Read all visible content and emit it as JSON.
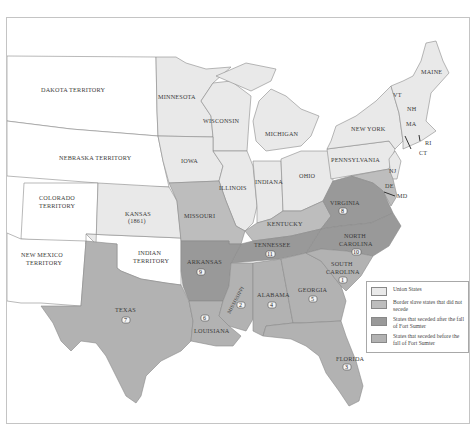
{
  "colors": {
    "union": "#e9e9e9",
    "border_slave": "#bdbdbd",
    "seceded_after": "#999999",
    "seceded_before": "#b2b2b2",
    "territory": "#ffffff",
    "frame": "#c4c4c4"
  },
  "territories": {
    "dakota": "DAKOTA TERRITORY",
    "nebraska": "NEBRASKA TERRITORY",
    "colorado_1": "COLORADO",
    "colorado_2": "TERRITORY",
    "new_mexico_1": "NEW MEXICO",
    "new_mexico_2": "TERRITORY",
    "indian_1": "INDIAN",
    "indian_2": "TERRITORY"
  },
  "union_states": {
    "minnesota": "MINNESOTA",
    "wisconsin": "WISCONSIN",
    "michigan": "MICHIGAN",
    "iowa": "IOWA",
    "illinois": "ILLINOIS",
    "indiana": "INDIANA",
    "ohio": "OHIO",
    "kansas": "KANSAS",
    "kansas_year": "(1861)",
    "pennsylvania": "PENNSYLVANIA",
    "new_york": "NEW YORK",
    "maine": "MAINE",
    "vermont": "VT",
    "new_hampshire": "NH",
    "massachusetts": "MA",
    "rhode_island": "RI",
    "connecticut": "CT",
    "new_jersey": "NJ"
  },
  "border_states": {
    "missouri": "MISSOURI",
    "kentucky": "KENTUCKY",
    "delaware": "DE",
    "maryland": "MD"
  },
  "seceded_after": {
    "virginia": {
      "name": "VIRGINIA",
      "order": "8"
    },
    "arkansas": {
      "name": "ARKANSAS",
      "order": "9"
    },
    "tennessee": {
      "name": "TENNESSEE",
      "order": "11"
    },
    "north_carolina_1": "NORTH",
    "north_carolina_2": "CAROLINA",
    "north_carolina_order": "10"
  },
  "seceded_before": {
    "south_carolina_1": "SOUTH",
    "south_carolina_2": "CAROLINA",
    "south_carolina_order": "1",
    "mississippi": {
      "name": "MISSISSIPPI",
      "order": "2"
    },
    "florida": {
      "name": "FLORIDA",
      "order": "3"
    },
    "alabama": {
      "name": "ALABAMA",
      "order": "4"
    },
    "georgia": {
      "name": "GEORGIA",
      "order": "5"
    },
    "louisiana": {
      "name": "LOUISIANA",
      "order": "6"
    },
    "texas": {
      "name": "TEXAS",
      "order": "7"
    }
  },
  "legend": {
    "items": [
      {
        "label": "Union States",
        "swatch": "union"
      },
      {
        "label": "Border slave states that did not secede",
        "swatch": "border_slave"
      },
      {
        "label": "States that seceded after the fall of Fort Sumter",
        "swatch": "seceded_after"
      },
      {
        "label": "States that seceded before the fall of Fort Sumter",
        "swatch": "seceded_before"
      }
    ]
  }
}
